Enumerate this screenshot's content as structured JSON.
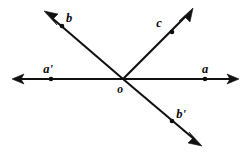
{
  "figure": {
    "background_color": "#ffffff",
    "line_color": "#111111",
    "label_color": "#0a0a0a",
    "vertex": {
      "name": "o",
      "label": "o",
      "x": 123,
      "y": 79,
      "label_x": 120,
      "label_y": 92
    },
    "labels": {
      "b": "b",
      "c": "c",
      "a_prime": "a'",
      "a": "a",
      "o": "o",
      "b_prime": "b'"
    },
    "rays": [
      {
        "id": "ray-b",
        "label": "b",
        "label_x": 69,
        "label_y": 22,
        "from_x": 123,
        "from_y": 79,
        "to_x": 47,
        "to_y": 14,
        "arrow": true,
        "dot_x": 62,
        "dot_y": 26,
        "direction": "upper-left"
      },
      {
        "id": "ray-c",
        "label": "c",
        "label_x": 159,
        "label_y": 27,
        "from_x": 123,
        "from_y": 79,
        "to_x": 192,
        "to_y": 10,
        "arrow": true,
        "dot_x": 172,
        "dot_y": 32,
        "direction": "upper-right"
      },
      {
        "id": "ray-a-prime",
        "label": "a'",
        "label_x": 45,
        "label_y": 73,
        "from_x": 123,
        "from_y": 79,
        "to_x": 13,
        "to_y": 79,
        "arrow": true,
        "dot_x": 51,
        "dot_y": 79,
        "direction": "left"
      },
      {
        "id": "ray-a",
        "label": "a",
        "label_x": 202,
        "label_y": 73,
        "from_x": 123,
        "from_y": 79,
        "to_x": 238,
        "to_y": 79,
        "arrow": true,
        "dot_x": 205,
        "dot_y": 79,
        "direction": "right"
      },
      {
        "id": "ray-b-prime",
        "label": "b'",
        "label_x": 178,
        "label_y": 118,
        "from_x": 123,
        "from_y": 79,
        "to_x": 200,
        "to_y": 144,
        "arrow": true,
        "dot_x": 172,
        "dot_y": 121,
        "direction": "lower-right"
      }
    ],
    "lines": [
      {
        "id": "line-aa-prime",
        "name": "line a'a",
        "endpoints": [
          "a'",
          "a"
        ]
      },
      {
        "id": "line-bb-prime",
        "name": "line bb'",
        "endpoints": [
          "b",
          "b'"
        ]
      },
      {
        "id": "ray-oc",
        "name": "ray oc",
        "endpoints": [
          "o",
          "c"
        ]
      }
    ]
  }
}
